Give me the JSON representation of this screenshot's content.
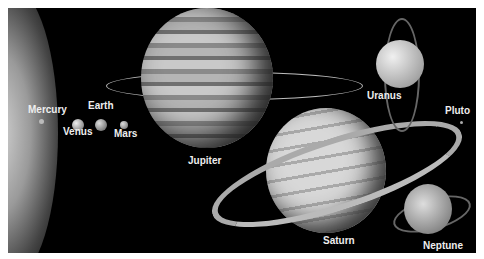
{
  "labels": {
    "mercury": "Mercury",
    "venus": "Venus",
    "earth": "Earth",
    "mars": "Mars",
    "jupiter": "Jupiter",
    "saturn": "Saturn",
    "uranus": "Uranus",
    "neptune": "Neptune",
    "pluto": "Pluto"
  }
}
